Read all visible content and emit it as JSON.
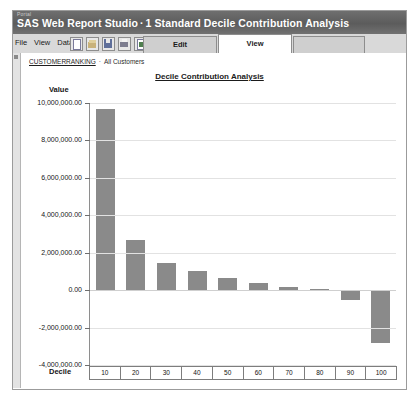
{
  "window": {
    "portal_tag": "Portal",
    "app_name": "SAS Web Report Studio",
    "title_separator": "·",
    "report_name": "1 Standard Decile Contribution Analysis"
  },
  "menu": {
    "items": [
      {
        "label": "File"
      },
      {
        "label": "View"
      },
      {
        "label": "Data"
      }
    ]
  },
  "toolbar": {
    "buttons": [
      {
        "name": "new-report-icon",
        "title": "New"
      },
      {
        "name": "open-report-icon",
        "title": "Open"
      },
      {
        "name": "save-report-icon",
        "title": "Save"
      },
      {
        "name": "print-icon",
        "title": "Print"
      },
      {
        "name": "export-icon",
        "title": "Export"
      }
    ]
  },
  "tabs": [
    {
      "label": "Edit",
      "active": false
    },
    {
      "label": "View",
      "active": true
    }
  ],
  "breadcrumb": {
    "root": "CUSTOMERRANKING",
    "separator": "·",
    "current": "All Customers"
  },
  "colors": {
    "bar_fill": "#8a8a8a",
    "titlebar": "#5c5c5c",
    "grid": "#e2e2e2",
    "axis": "#7d7d7d"
  },
  "chart_data": {
    "type": "bar",
    "title": "Decile Contribution Analysis",
    "xlabel": "Decile",
    "ylabel": "Value",
    "categories": [
      "10",
      "20",
      "30",
      "40",
      "50",
      "60",
      "70",
      "80",
      "90",
      "100"
    ],
    "values": [
      9700000,
      2700000,
      1430000,
      1020000,
      650000,
      400000,
      150000,
      60000,
      -520000,
      -2800000
    ],
    "ylim": [
      -4000000,
      10000000
    ],
    "yticks": [
      10000000,
      8000000,
      6000000,
      4000000,
      2000000,
      0,
      -2000000,
      -4000000
    ],
    "ytick_labels": [
      "10,000,000.00",
      "8,000,000.00",
      "6,000,000.00",
      "4,000,000.00",
      "2,000,000.00",
      "0.00",
      "-2,000,000.00",
      "-4,000,000.00"
    ],
    "grid": true,
    "legend": false,
    "series": [
      {
        "name": "Value",
        "values": [
          9700000,
          2700000,
          1430000,
          1020000,
          650000,
          400000,
          150000,
          60000,
          -520000,
          -2800000
        ]
      }
    ]
  }
}
